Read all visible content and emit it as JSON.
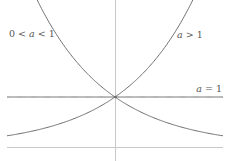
{
  "chart_data": {
    "type": "line",
    "title": "",
    "xlabel": "",
    "ylabel": "",
    "xlim": [
      -2.16,
      2.16
    ],
    "ylim": [
      -0.28,
      2.94
    ],
    "grid": false,
    "legend": "none",
    "series": [
      {
        "name": "0 < a < 1",
        "function": "(1/2)^x",
        "base": 0.5,
        "label_parts": [
          "0 < ",
          "a",
          " < 1"
        ],
        "label_position": "top-left"
      },
      {
        "name": "a > 1",
        "function": "2^x",
        "base": 2,
        "label_parts": [
          "",
          "a",
          " > 1"
        ],
        "label_position": "top-right"
      },
      {
        "name": "a = 1",
        "function": "1^x",
        "base": 1,
        "label_parts": [
          "",
          "a",
          " = 1"
        ],
        "label_position": "right"
      }
    ],
    "intersection_point": [
      0,
      1
    ],
    "annotations": [
      "0 < a < 1",
      "a > 1",
      "a = 1"
    ]
  },
  "colors": {
    "curve": "#6e6e6e",
    "axis": "#c8c8c8",
    "text": "#555555"
  }
}
